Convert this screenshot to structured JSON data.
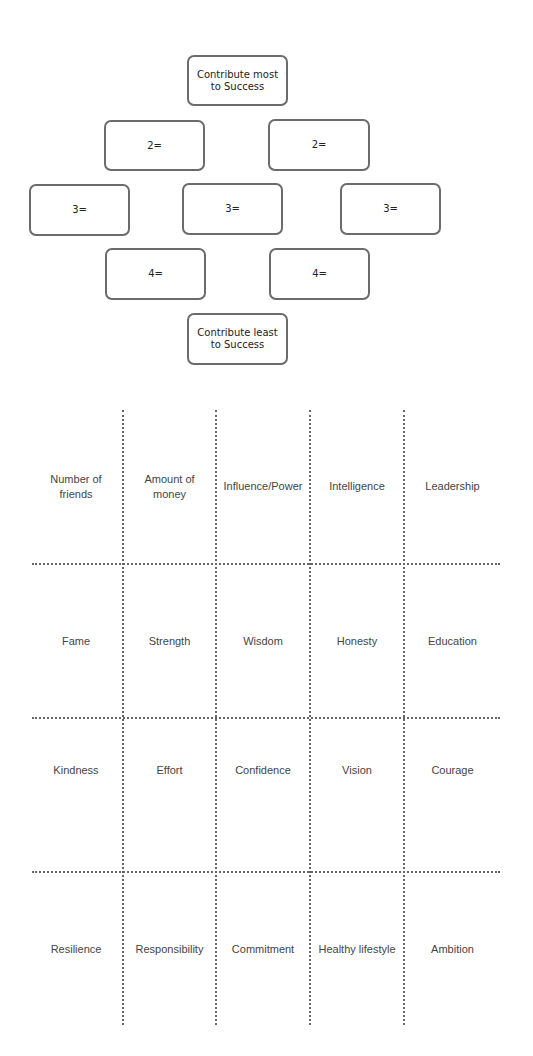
{
  "diamond": {
    "top": "Contribute most to Success",
    "row2": [
      "2=",
      "2="
    ],
    "row3": [
      "3=",
      "3=",
      "3="
    ],
    "row4": [
      "4=",
      "4="
    ],
    "bottom": "Contribute least to Success"
  },
  "grid": {
    "rows": [
      [
        "Number of friends",
        "Amount of money",
        "Influence/Power",
        "Intelligence",
        "Leadership"
      ],
      [
        "Fame",
        "Strength",
        "Wisdom",
        "Honesty",
        "Education"
      ],
      [
        "Kindness",
        "Effort",
        "Confidence",
        "Vision",
        "Courage"
      ],
      [
        "Resilience",
        "Responsibility",
        "Commitment",
        "Healthy lifestyle",
        "Ambition"
      ]
    ]
  }
}
